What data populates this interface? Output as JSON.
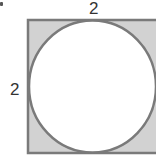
{
  "figure": {
    "labels": {
      "top_side": "2",
      "left_side": "2"
    },
    "colors": {
      "shaded_region": "#d2d2d2",
      "outline": "#7a7a7a",
      "circle_fill": "#ffffff",
      "label_text": "#333333"
    },
    "shapes": {
      "square": {
        "x": 27,
        "y": 19,
        "width": 131,
        "height": 135
      },
      "circle": {
        "cx": 92,
        "cy": 86.5,
        "rx": 64,
        "ry": 66.5
      }
    }
  }
}
